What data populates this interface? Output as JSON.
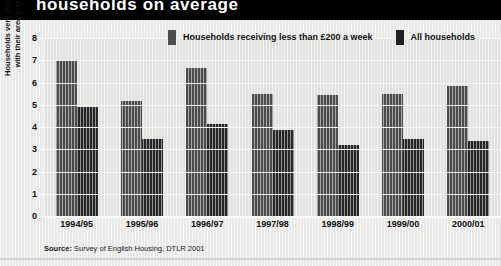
{
  "title": {
    "text": "households on average"
  },
  "legend": {
    "position": "top-center",
    "entries": [
      {
        "label": "Households receiving less than £200 a week",
        "color": "#4d4d4d",
        "swatch": "gray"
      },
      {
        "label": "All households",
        "color": "#1f1f1f",
        "swatch": "black"
      }
    ]
  },
  "source": {
    "label": "Source:",
    "text": "Survey of English Housing, DTLR 2001"
  },
  "chart_data": {
    "type": "bar",
    "title": "households on average",
    "xlabel": "",
    "ylabel": "Households very dissatisfied with their area (per cent)",
    "ylim": [
      0,
      8
    ],
    "yticks": [
      0,
      1,
      2,
      3,
      4,
      5,
      6,
      7,
      8
    ],
    "ytick_labels": [
      "0",
      "1",
      "2",
      "3",
      "4",
      "5",
      "6",
      "7",
      "8"
    ],
    "grid": true,
    "categories": [
      "1994/95",
      "1995/96",
      "1996/97",
      "1997/98",
      "1998/99",
      "1999/00",
      "2000/01"
    ],
    "series": [
      {
        "name": "Households receiving less than £200 a week",
        "color": "#4d4d4d",
        "values": [
          7.0,
          5.15,
          6.65,
          5.5,
          5.45,
          5.5,
          5.85
        ]
      },
      {
        "name": "All households",
        "color": "#262626",
        "values": [
          4.9,
          3.45,
          4.15,
          3.85,
          3.2,
          3.45,
          3.35
        ]
      }
    ]
  }
}
